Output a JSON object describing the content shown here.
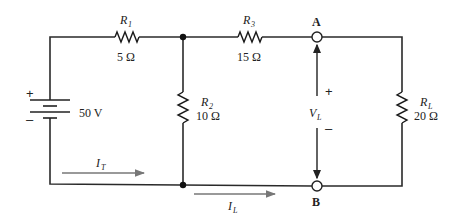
{
  "circuit": {
    "source": {
      "label": "50 V",
      "plus": "+",
      "minus": "–"
    },
    "resistors": [
      {
        "id": "R1",
        "name": "R",
        "sub": "1",
        "value": "5 Ω"
      },
      {
        "id": "R2",
        "name": "R",
        "sub": "2",
        "value": "10 Ω"
      },
      {
        "id": "R3",
        "name": "R",
        "sub": "3",
        "value": "15 Ω"
      },
      {
        "id": "RL",
        "name": "R",
        "sub": "L",
        "value": "20 Ω"
      }
    ],
    "terminals": {
      "a": "A",
      "b": "B"
    },
    "voltage": {
      "name": "V",
      "sub": "L",
      "plus": "+",
      "minus": "–"
    },
    "currents": [
      {
        "id": "IT",
        "name": "I",
        "sub": "T"
      },
      {
        "id": "IL",
        "name": "I",
        "sub": "L"
      }
    ]
  }
}
